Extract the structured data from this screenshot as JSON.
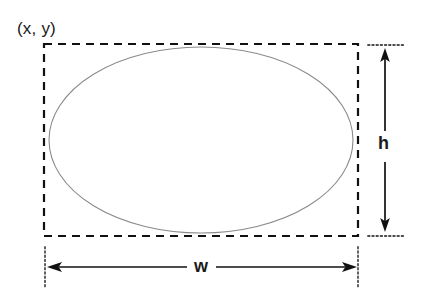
{
  "diagram": {
    "labels": {
      "origin": "(x, y)",
      "height": "h",
      "width": "w"
    },
    "colors": {
      "bounding_box": "#111111",
      "ellipse": "#8a8a8a",
      "dimension_line": "#111111",
      "extension_line": "#4d4d4d",
      "text": "#1a1a1a",
      "background": "#ffffff"
    },
    "geometry": {
      "bounding_box": {
        "x": 44,
        "y": 44,
        "width": 314,
        "height": 192
      },
      "ellipse": {
        "cx": 201,
        "cy": 140,
        "rx": 152,
        "ry": 93
      },
      "height_dimension": {
        "x": 385,
        "y_top": 52,
        "y_bottom": 235
      },
      "width_dimension": {
        "y": 267,
        "x_left": 46,
        "x_right": 359
      }
    }
  }
}
